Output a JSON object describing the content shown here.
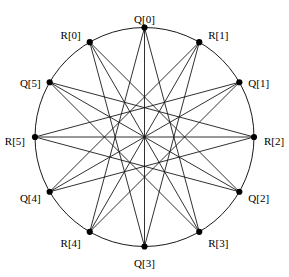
{
  "figure": {
    "background_color": "#ffffff",
    "line_color": "#1a1a1a",
    "node_color": "#000000",
    "label_color": "#000000"
  },
  "geometry": {
    "center_x": 144.5,
    "center_y": 137,
    "radius": 109.5,
    "node_radius": 3.1,
    "node_count": 12,
    "angle_step_degrees": 30,
    "chord_span_steps": 4
  },
  "nodes": [
    {
      "id": "Q0",
      "label": "Q[0]",
      "angle": 90,
      "label_dx": 0,
      "label_dy": -9,
      "anchor": "middle"
    },
    {
      "id": "R1",
      "label": "R[1]",
      "angle": 60,
      "label_dx": 9,
      "label_dy": -7,
      "anchor": "start"
    },
    {
      "id": "Q1",
      "label": "Q[1]",
      "angle": 30,
      "label_dx": 9,
      "label_dy": 1,
      "anchor": "start"
    },
    {
      "id": "R2",
      "label": "R[2]",
      "angle": 0,
      "label_dx": 10,
      "label_dy": 4,
      "anchor": "start"
    },
    {
      "id": "Q2",
      "label": "Q[2]",
      "angle": -30,
      "label_dx": 9,
      "label_dy": 6,
      "anchor": "start"
    },
    {
      "id": "R3",
      "label": "R[3]",
      "angle": -60,
      "label_dx": 9,
      "label_dy": 11,
      "anchor": "start"
    },
    {
      "id": "Q3",
      "label": "Q[3]",
      "angle": -90,
      "label_dx": 0,
      "label_dy": 16,
      "anchor": "middle"
    },
    {
      "id": "R4",
      "label": "R[4]",
      "angle": -120,
      "label_dx": -9,
      "label_dy": 11,
      "anchor": "end"
    },
    {
      "id": "Q4",
      "label": "Q[4]",
      "angle": -150,
      "label_dx": -9,
      "label_dy": 6,
      "anchor": "end"
    },
    {
      "id": "R5",
      "label": "R[5]",
      "angle": 180,
      "label_dx": -10,
      "label_dy": 4,
      "anchor": "end"
    },
    {
      "id": "Q5",
      "label": "Q[5]",
      "angle": 150,
      "label_dx": -9,
      "label_dy": 1,
      "anchor": "end"
    },
    {
      "id": "R0",
      "label": "R[0]",
      "angle": 120,
      "label_dx": -9,
      "label_dy": -7,
      "anchor": "end"
    }
  ],
  "edges": [
    {
      "from": "Q0",
      "to": "R4"
    },
    {
      "from": "Q0",
      "to": "R3"
    },
    {
      "from": "R1",
      "to": "Q4"
    },
    {
      "from": "R1",
      "to": "R4"
    },
    {
      "from": "Q1",
      "to": "R5"
    },
    {
      "from": "Q1",
      "to": "Q4"
    },
    {
      "from": "R2",
      "to": "Q5"
    },
    {
      "from": "R2",
      "to": "R5"
    },
    {
      "from": "Q2",
      "to": "R0"
    },
    {
      "from": "Q2",
      "to": "Q5"
    },
    {
      "from": "R3",
      "to": "Q0"
    },
    {
      "from": "R3",
      "to": "R0"
    },
    {
      "from": "Q3",
      "to": "R1"
    },
    {
      "from": "Q3",
      "to": "Q0"
    },
    {
      "from": "R4",
      "to": "Q1"
    },
    {
      "from": "R4",
      "to": "R1"
    },
    {
      "from": "Q4",
      "to": "R2"
    },
    {
      "from": "Q4",
      "to": "Q1"
    },
    {
      "from": "R5",
      "to": "Q2"
    },
    {
      "from": "R5",
      "to": "R2"
    },
    {
      "from": "Q5",
      "to": "R3"
    },
    {
      "from": "Q5",
      "to": "Q2"
    },
    {
      "from": "R0",
      "to": "Q3"
    },
    {
      "from": "R0",
      "to": "R3"
    }
  ]
}
